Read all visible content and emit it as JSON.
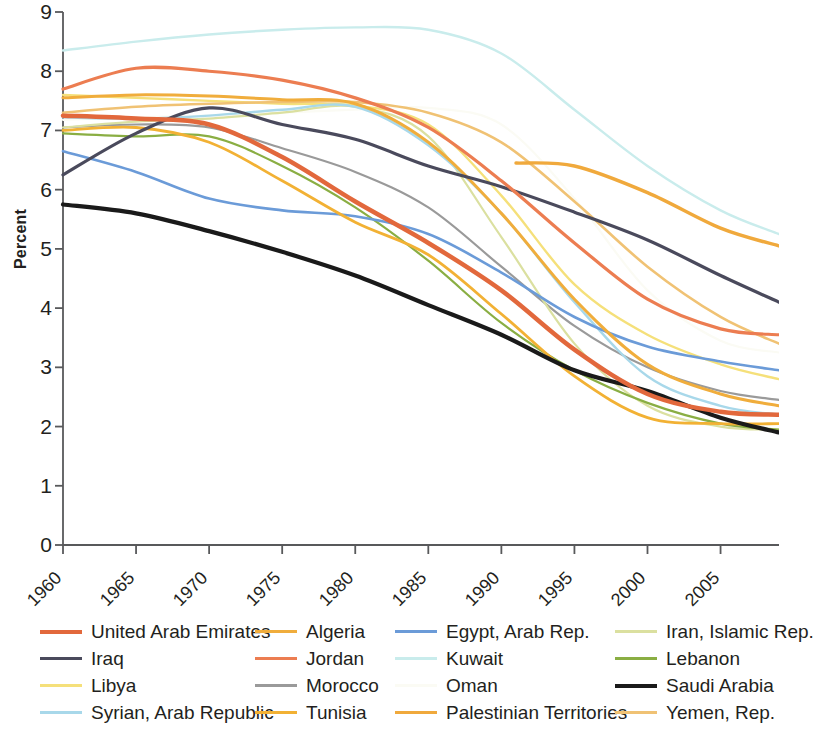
{
  "chart": {
    "type": "line",
    "ylabel": "Percent",
    "xlabel": "",
    "title": ""
  },
  "axes": {
    "y_ticks": [
      "0",
      "1",
      "2",
      "3",
      "4",
      "5",
      "6",
      "7",
      "8",
      "9"
    ],
    "y_min": 0,
    "y_max": 9,
    "x_ticks": [
      "1960",
      "1965",
      "1970",
      "1975",
      "1980",
      "1985",
      "1990",
      "1995",
      "2000",
      "2005"
    ],
    "x_min": 1960,
    "x_max": 2009,
    "grid": false
  },
  "legend": {
    "position": "bottom",
    "columns": [
      {
        "items": [
          {
            "label": "United Arab Emirates",
            "color": "#e2683c"
          },
          {
            "label": "Iraq",
            "color": "#4a4a5c"
          },
          {
            "label": "Libya",
            "color": "#f5e07a"
          },
          {
            "label": "Syrian, Arab Republic",
            "color": "#a8d8ea"
          }
        ]
      },
      {
        "items": [
          {
            "label": "Algeria",
            "color": "#f0ad3c"
          },
          {
            "label": "Jordan",
            "color": "#ec7d51"
          },
          {
            "label": "Morocco",
            "color": "#9a9a9a"
          },
          {
            "label": "Tunisia",
            "color": "#f2b134"
          }
        ]
      },
      {
        "items": [
          {
            "label": "Egypt, Arab Rep.",
            "color": "#6b9bd8"
          },
          {
            "label": "Kuwait",
            "color": "#c9ecec"
          },
          {
            "label": "Oman",
            "color": "#fbfbf4"
          },
          {
            "label": "Palestinian Territories",
            "color": "#f0a93c"
          }
        ]
      },
      {
        "items": [
          {
            "label": "Iran, Islamic Rep.",
            "color": "#dbe0a0"
          },
          {
            "label": "Lebanon",
            "color": "#8aae43"
          },
          {
            "label": "Saudi Arabia",
            "color": "#1a1a1a"
          },
          {
            "label": "Yemen, Rep.",
            "color": "#f0c274"
          }
        ]
      }
    ]
  },
  "chart_data": {
    "type": "line",
    "title": "",
    "xlabel": "",
    "ylabel": "Percent",
    "xlim": [
      1960,
      2009
    ],
    "ylim": [
      0,
      9
    ],
    "grid": false,
    "legend_position": "bottom",
    "x": [
      1960,
      1965,
      1970,
      1975,
      1980,
      1985,
      1990,
      1995,
      2000,
      2005,
      2009
    ],
    "series": [
      {
        "name": "United Arab Emirates",
        "color": "#e2683c",
        "width": 4.5,
        "x": [
          1960,
          1965,
          1970,
          1975,
          1980,
          1985,
          1990,
          1995,
          2000,
          2005,
          2009
        ],
        "values": [
          7.25,
          7.2,
          7.1,
          6.55,
          5.8,
          5.1,
          4.3,
          3.3,
          2.55,
          2.25,
          2.2
        ]
      },
      {
        "name": "Iraq",
        "color": "#4a4a5c",
        "width": 3.2,
        "x": [
          1960,
          1965,
          1970,
          1975,
          1980,
          1985,
          1990,
          1995,
          2000,
          2005,
          2009
        ],
        "values": [
          6.25,
          6.95,
          7.38,
          7.1,
          6.85,
          6.4,
          6.05,
          5.62,
          5.15,
          4.55,
          4.1
        ]
      },
      {
        "name": "Libya",
        "color": "#f5e07a",
        "width": 2.4,
        "x": [
          1960,
          1965,
          1970,
          1975,
          1980,
          1985,
          1990,
          1995,
          2000,
          2005,
          2009
        ],
        "values": [
          7.6,
          7.55,
          7.5,
          7.45,
          7.42,
          7.1,
          5.9,
          4.4,
          3.55,
          3.05,
          2.8
        ]
      },
      {
        "name": "Syrian, Arab Republic",
        "color": "#a8d8ea",
        "width": 2.4,
        "x": [
          1960,
          1965,
          1970,
          1975,
          1980,
          1985,
          1990,
          1995,
          2000,
          2005,
          2009
        ],
        "values": [
          7.22,
          7.2,
          7.25,
          7.35,
          7.4,
          6.75,
          5.6,
          4.1,
          2.85,
          2.35,
          2.2
        ]
      },
      {
        "name": "Algeria",
        "color": "#f0ad3c",
        "width": 3.0,
        "x": [
          1960,
          1965,
          1970,
          1975,
          1980,
          1985,
          1990,
          1995,
          2000,
          2005,
          2009
        ],
        "values": [
          7.55,
          7.6,
          7.58,
          7.52,
          7.45,
          6.8,
          5.6,
          4.15,
          3.05,
          2.55,
          2.35
        ]
      },
      {
        "name": "Jordan",
        "color": "#ec7d51",
        "width": 3.2,
        "x": [
          1960,
          1965,
          1970,
          1975,
          1980,
          1985,
          1990,
          1995,
          2000,
          2005,
          2009
        ],
        "values": [
          7.7,
          8.05,
          8.0,
          7.85,
          7.55,
          7.05,
          6.15,
          5.1,
          4.15,
          3.65,
          3.55
        ]
      },
      {
        "name": "Morocco",
        "color": "#9a9a9a",
        "width": 2.2,
        "x": [
          1960,
          1965,
          1970,
          1975,
          1980,
          1985,
          1990,
          1995,
          2000,
          2005,
          2009
        ],
        "values": [
          7.05,
          7.1,
          7.05,
          6.7,
          6.3,
          5.7,
          4.7,
          3.7,
          3.0,
          2.6,
          2.45
        ]
      },
      {
        "name": "Tunisia",
        "color": "#f2b134",
        "width": 2.8,
        "x": [
          1960,
          1965,
          1970,
          1975,
          1980,
          1985,
          1990,
          1995,
          2000,
          2005,
          2009
        ],
        "values": [
          7.0,
          7.05,
          6.8,
          6.15,
          5.45,
          4.9,
          3.9,
          2.85,
          2.15,
          2.05,
          2.05
        ]
      },
      {
        "name": "Egypt, Arab Rep.",
        "color": "#6b9bd8",
        "width": 2.6,
        "x": [
          1960,
          1965,
          1970,
          1975,
          1980,
          1985,
          1990,
          1995,
          2000,
          2005,
          2009
        ],
        "values": [
          6.65,
          6.3,
          5.85,
          5.65,
          5.55,
          5.25,
          4.6,
          3.85,
          3.35,
          3.1,
          2.95
        ]
      },
      {
        "name": "Kuwait",
        "color": "#c9ecec",
        "width": 2.4,
        "x": [
          1960,
          1965,
          1970,
          1975,
          1980,
          1985,
          1990,
          1995,
          2000,
          2005,
          2009
        ],
        "values": [
          8.35,
          8.5,
          8.62,
          8.7,
          8.74,
          8.7,
          8.3,
          7.35,
          6.4,
          5.65,
          5.25
        ]
      },
      {
        "name": "Oman",
        "color": "#fbfbf4",
        "width": 2.2,
        "x": [
          1960,
          1965,
          1970,
          1975,
          1980,
          1985,
          1990,
          1995,
          2000,
          2005,
          2009
        ],
        "values": [
          7.18,
          7.22,
          7.25,
          7.3,
          7.35,
          7.38,
          7.1,
          5.85,
          4.3,
          3.45,
          3.25
        ]
      },
      {
        "name": "Palestinian Territories",
        "color": "#f0a93c",
        "width": 3.4,
        "x": [
          1991,
          1995,
          2000,
          2005,
          2009
        ],
        "values": [
          6.45,
          6.4,
          5.95,
          5.35,
          5.05
        ]
      },
      {
        "name": "Iran, Islamic Rep.",
        "color": "#dbe0a0",
        "width": 2.2,
        "x": [
          1960,
          1965,
          1970,
          1975,
          1980,
          1985,
          1990,
          1995,
          2000,
          2005,
          2009
        ],
        "values": [
          7.05,
          7.15,
          7.2,
          7.3,
          7.4,
          6.9,
          5.2,
          3.4,
          2.35,
          2.0,
          1.95
        ]
      },
      {
        "name": "Lebanon",
        "color": "#8aae43",
        "width": 2.2,
        "x": [
          1960,
          1965,
          1970,
          1975,
          1980,
          1985,
          1990,
          1995,
          2000,
          2005,
          2009
        ],
        "values": [
          6.95,
          6.9,
          6.9,
          6.4,
          5.7,
          4.8,
          3.75,
          2.95,
          2.4,
          2.05,
          1.95
        ]
      },
      {
        "name": "Saudi Arabia",
        "color": "#1a1a1a",
        "width": 4.2,
        "x": [
          1960,
          1965,
          1970,
          1975,
          1980,
          1985,
          1990,
          1995,
          2000,
          2005,
          2009
        ],
        "values": [
          5.75,
          5.6,
          5.3,
          4.95,
          4.55,
          4.05,
          3.55,
          2.95,
          2.6,
          2.15,
          1.9
        ]
      },
      {
        "name": "Yemen, Rep.",
        "color": "#f0c274",
        "width": 2.6,
        "x": [
          1960,
          1965,
          1970,
          1975,
          1980,
          1985,
          1990,
          1995,
          2000,
          2005,
          2009
        ],
        "values": [
          7.3,
          7.4,
          7.45,
          7.48,
          7.48,
          7.3,
          6.8,
          5.8,
          4.7,
          3.85,
          3.4
        ]
      }
    ]
  }
}
